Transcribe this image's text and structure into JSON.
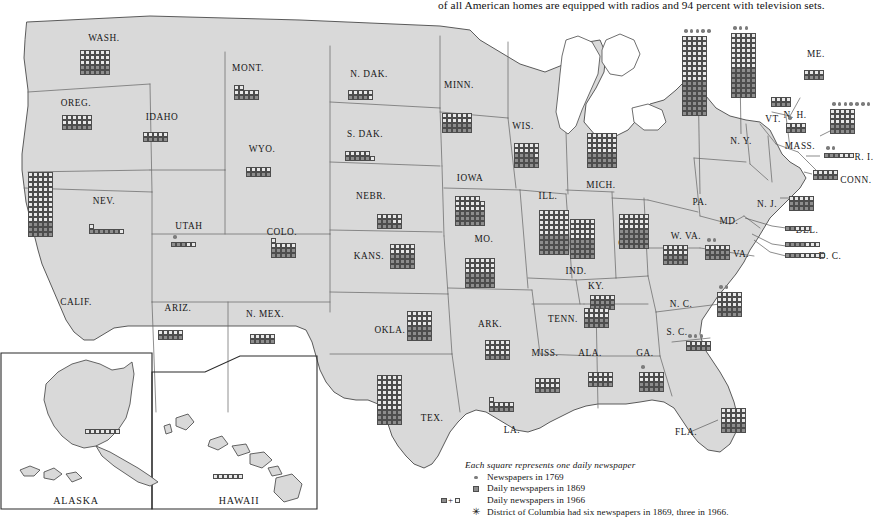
{
  "header": {
    "text": "of all American homes are equipped with radios and 94 percent with television sets."
  },
  "legend": {
    "title": "Each square represents one daily newspaper",
    "items": [
      {
        "symbol": "dot",
        "label": "Newspapers in 1769"
      },
      {
        "symbol": "dark-square",
        "label": "Daily newspapers in 1869"
      },
      {
        "symbol": "dark-plus-light-square",
        "label": "Daily newspapers in 1966"
      },
      {
        "symbol": "asterisk",
        "label": "District of Columbia had six newspapers in 1869, three in 1966."
      }
    ]
  },
  "insets": [
    {
      "name": "ALASKA"
    },
    {
      "name": "HAWAII"
    }
  ],
  "colors": {
    "land": "#d9d9d9",
    "water": "#ffffff",
    "square_1869": "#8d8d8d",
    "square_1966": "#e8e8e8",
    "border": "#4d4d4d",
    "dot": "#7c7c7c"
  },
  "chart_data": {
    "type": "map",
    "title": "Each square represents one daily newspaper",
    "unit": "one daily newspaper per square",
    "series": [
      {
        "name": "Newspapers in 1769",
        "symbol": "dot"
      },
      {
        "name": "Daily newspapers in 1869",
        "symbol": "dark square"
      },
      {
        "name": "Daily newspapers in 1966",
        "symbol": "dark + light square"
      }
    ],
    "states": [
      {
        "code": "WASH.",
        "label": "WASH.",
        "lx": 104,
        "ly": 26,
        "gx": 80,
        "gy": 38,
        "cols": 6,
        "dark": 12,
        "light": 18,
        "dots1769": 0
      },
      {
        "code": "OREG.",
        "label": "OREG.",
        "lx": 76,
        "ly": 91,
        "gx": 62,
        "gy": 103,
        "cols": 6,
        "dark": 6,
        "light": 12,
        "dots1769": 0
      },
      {
        "code": "IDAHO",
        "label": "IDAHO",
        "lx": 162,
        "ly": 105,
        "gx": 143,
        "gy": 120,
        "cols": 5,
        "dark": 5,
        "light": 5,
        "dots1769": 0
      },
      {
        "code": "MONT.",
        "label": "MONT.",
        "lx": 248,
        "ly": 56,
        "gx": 234,
        "gy": 73,
        "cols": 5,
        "dark": 5,
        "light": 7,
        "dots1769": 0
      },
      {
        "code": "WYO.",
        "label": "WYO.",
        "lx": 262,
        "ly": 137,
        "gx": 246,
        "gy": 155,
        "cols": 5,
        "dark": 5,
        "light": 5,
        "dots1769": 0
      },
      {
        "code": "N. DAK.",
        "label": "N. DAK.",
        "lx": 369,
        "ly": 62,
        "gx": 348,
        "gy": 78,
        "cols": 5,
        "dark": 4,
        "light": 6,
        "dots1769": 0
      },
      {
        "code": "S. DAK.",
        "label": "S. DAK.",
        "lx": 365,
        "ly": 122,
        "gx": 345,
        "gy": 139,
        "cols": 6,
        "dark": 5,
        "light": 6,
        "dots1769": 0
      },
      {
        "code": "MINN.",
        "label": "MINN.",
        "lx": 459,
        "ly": 73,
        "gx": 442,
        "gy": 101,
        "cols": 6,
        "dark": 12,
        "light": 12,
        "dots1769": 0
      },
      {
        "code": "WIS.",
        "label": "WIS.",
        "lx": 523,
        "ly": 114,
        "gx": 514,
        "gy": 131,
        "cols": 5,
        "dark": 14,
        "light": 11,
        "dots1769": 0
      },
      {
        "code": "MICH.",
        "label": "MICH.",
        "lx": 601,
        "ly": 173,
        "gx": 587,
        "gy": 121,
        "cols": 6,
        "dark": 18,
        "light": 24,
        "dots1769": 0
      },
      {
        "code": "IOWA",
        "label": "IOWA",
        "lx": 470,
        "ly": 166,
        "gx": 455,
        "gy": 184,
        "cols": 6,
        "dark": 18,
        "light": 17,
        "dots1769": 0
      },
      {
        "code": "NEBR.",
        "label": "NEBR.",
        "lx": 371,
        "ly": 184,
        "gx": 377,
        "gy": 202,
        "cols": 5,
        "dark": 8,
        "light": 7,
        "dots1769": 0
      },
      {
        "code": "ILL.",
        "label": "ILL.",
        "lx": 548,
        "ly": 184,
        "gx": 539,
        "gy": 198,
        "cols": 6,
        "dark": 24,
        "light": 30,
        "dots1769": 0
      },
      {
        "code": "IND.",
        "label": "IND.",
        "lx": 576,
        "ly": 259,
        "gx": 570,
        "gy": 207,
        "cols": 5,
        "dark": 20,
        "light": 20,
        "dots1769": 0
      },
      {
        "code": "OHIO",
        "label": "OHIO",
        "lx": 631,
        "ly": 231,
        "gx": 619,
        "gy": 202,
        "cols": 6,
        "dark": 24,
        "light": 18,
        "dots1769": 0
      },
      {
        "code": "COLO.",
        "label": "COLO.",
        "lx": 282,
        "ly": 220,
        "gx": 271,
        "gy": 226,
        "cols": 5,
        "dark": 10,
        "light": 6,
        "dots1769": 0
      },
      {
        "code": "UTAH",
        "label": "UTAH",
        "lx": 189,
        "ly": 214,
        "gx": 171,
        "gy": 230,
        "cols": 5,
        "dark": 3,
        "light": 2,
        "dots1769": 1
      },
      {
        "code": "NEV.",
        "label": "NEV.",
        "lx": 104,
        "ly": 189,
        "gx": 89,
        "gy": 212,
        "cols": 7,
        "dark": 6,
        "light": 2,
        "dots1769": 0
      },
      {
        "code": "CALIF.",
        "label": "CALIF.",
        "lx": 76,
        "ly": 290,
        "gx": 28,
        "gy": 160,
        "cols": 5,
        "dark": 15,
        "light": 50,
        "dots1769": 0
      },
      {
        "code": "ARIZ.",
        "label": "ARIZ.",
        "lx": 178,
        "ly": 296,
        "gx": 158,
        "gy": 318,
        "cols": 5,
        "dark": 5,
        "light": 5,
        "dots1769": 0
      },
      {
        "code": "N. MEX.",
        "label": "N. MEX.",
        "lx": 265,
        "ly": 302,
        "gx": 250,
        "gy": 322,
        "cols": 5,
        "dark": 5,
        "light": 5,
        "dots1769": 0
      },
      {
        "code": "KANS.",
        "label": "KANS.",
        "lx": 369,
        "ly": 244,
        "gx": 390,
        "gy": 232,
        "cols": 5,
        "dark": 15,
        "light": 10,
        "dots1769": 0
      },
      {
        "code": "MO.",
        "label": "MO.",
        "lx": 484,
        "ly": 227,
        "gx": 465,
        "gy": 246,
        "cols": 6,
        "dark": 18,
        "light": 18,
        "dots1769": 0
      },
      {
        "code": "KY.",
        "label": "KY.",
        "lx": 596,
        "ly": 274,
        "gx": 590,
        "gy": 283,
        "cols": 5,
        "dark": 10,
        "light": 5,
        "dots1769": 0
      },
      {
        "code": "OKLA.",
        "label": "OKLA.",
        "lx": 390,
        "ly": 318,
        "gx": 407,
        "gy": 299,
        "cols": 5,
        "dark": 15,
        "light": 15,
        "dots1769": 0
      },
      {
        "code": "ARK.",
        "label": "ARK.",
        "lx": 490,
        "ly": 312,
        "gx": 485,
        "gy": 328,
        "cols": 5,
        "dark": 5,
        "light": 15,
        "dots1769": 0
      },
      {
        "code": "TENN.",
        "label": "TENN.",
        "lx": 563,
        "ly": 307,
        "gx": 584,
        "gy": 296,
        "cols": 5,
        "dark": 10,
        "light": 10,
        "dots1769": 0
      },
      {
        "code": "MISS.",
        "label": "MISS.",
        "lx": 545,
        "ly": 341,
        "gx": 535,
        "gy": 366,
        "cols": 5,
        "dark": 5,
        "light": 10,
        "dots1769": 0
      },
      {
        "code": "ALA.",
        "label": "ALA.",
        "lx": 590,
        "ly": 341,
        "gx": 588,
        "gy": 360,
        "cols": 5,
        "dark": 5,
        "light": 10,
        "dots1769": 0
      },
      {
        "code": "GA.",
        "label": "GA.",
        "lx": 645,
        "ly": 341,
        "gx": 639,
        "gy": 360,
        "cols": 5,
        "dark": 10,
        "light": 10,
        "dots1769": 1
      },
      {
        "code": "LA.",
        "label": "LA.",
        "lx": 512,
        "ly": 418,
        "gx": 489,
        "gy": 385,
        "cols": 5,
        "dark": 5,
        "light": 6,
        "dots1769": 0
      },
      {
        "code": "TEX.",
        "label": "TEX.",
        "lx": 432,
        "ly": 406,
        "gx": 377,
        "gy": 363,
        "cols": 5,
        "dark": 15,
        "light": 35,
        "dots1769": 0
      },
      {
        "code": "FLA.",
        "label": "FLA.",
        "lx": 686,
        "ly": 420,
        "gx": 721,
        "gy": 396,
        "cols": 5,
        "dark": 10,
        "light": 15,
        "dots1769": 0
      },
      {
        "code": "S. C.",
        "label": "S. C.",
        "lx": 677,
        "ly": 320,
        "gx": 686,
        "gy": 329,
        "cols": 5,
        "dark": 5,
        "light": 5,
        "dots1769": 3
      },
      {
        "code": "N. C.",
        "label": "N. C.",
        "lx": 681,
        "ly": 292,
        "gx": 717,
        "gy": 280,
        "cols": 5,
        "dark": 10,
        "light": 15,
        "dots1769": 2
      },
      {
        "code": "VA.",
        "label": "VA.",
        "lx": 741,
        "ly": 242,
        "gx": 705,
        "gy": 233,
        "cols": 5,
        "dark": 10,
        "light": 5,
        "dots1769": 2
      },
      {
        "code": "W. VA.",
        "label": "W. VA.",
        "lx": 686,
        "ly": 224,
        "gx": 663,
        "gy": 233,
        "cols": 5,
        "dark": 10,
        "light": 10,
        "dots1769": 0
      },
      {
        "code": "MD.",
        "label": "MD.",
        "lx": 729,
        "ly": 209,
        "gx": 785,
        "gy": 230,
        "cols": 7,
        "dark": 4,
        "light": 3,
        "dots1769": 0
      },
      {
        "code": "DEL.",
        "label": "DEL.",
        "lx": 807,
        "ly": 218,
        "gx": 785,
        "gy": 214,
        "cols": 5,
        "dark": 2,
        "light": 3,
        "dots1769": 0
      },
      {
        "code": "D. C.",
        "label": "D. C.",
        "lx": 830,
        "ly": 244,
        "gx": 785,
        "gy": 241,
        "cols": 8,
        "dark": 3,
        "light": 5,
        "dots1769": 0
      },
      {
        "code": "N. J.",
        "label": "N. J.",
        "lx": 767,
        "ly": 192,
        "gx": 789,
        "gy": 184,
        "cols": 5,
        "dark": 10,
        "light": 5,
        "dots1769": 0
      },
      {
        "code": "PA.",
        "label": "PA.",
        "lx": 700,
        "ly": 190,
        "gx": 682,
        "gy": 24,
        "cols": 5,
        "dark": 35,
        "light": 45,
        "dots1769": 5
      },
      {
        "code": "N. Y.",
        "label": "N. Y.",
        "lx": 741,
        "ly": 129,
        "gx": 731,
        "gy": 21,
        "cols": 5,
        "dark": 30,
        "light": 35,
        "dots1769": 3
      },
      {
        "code": "CONN.",
        "label": "CONN.",
        "lx": 856,
        "ly": 168,
        "gx": 813,
        "gy": 158,
        "cols": 5,
        "dark": 5,
        "light": 5,
        "dots1769": 0
      },
      {
        "code": "R. I.",
        "label": "R. I.",
        "lx": 864,
        "ly": 145,
        "gx": 824,
        "gy": 141,
        "cols": 6,
        "dark": 3,
        "light": 3,
        "dots1769": 2
      },
      {
        "code": "MASS.",
        "label": "MASS.",
        "lx": 800,
        "ly": 134,
        "gx": 830,
        "gy": 97,
        "cols": 5,
        "dark": 10,
        "light": 15,
        "dots1769": 7
      },
      {
        "code": "N. H.",
        "label": "N. H.",
        "lx": 795,
        "ly": 103,
        "gx": 786,
        "gy": 111,
        "cols": 4,
        "dark": 4,
        "light": 4,
        "dots1769": 1
      },
      {
        "code": "VT.",
        "label": "VT.",
        "lx": 773,
        "ly": 107,
        "gx": 771,
        "gy": 85,
        "cols": 4,
        "dark": 4,
        "light": 4,
        "dots1769": 0
      },
      {
        "code": "ME.",
        "label": "ME.",
        "lx": 816,
        "ly": 42,
        "gx": 804,
        "gy": 58,
        "cols": 4,
        "dark": 4,
        "light": 4,
        "dots1769": 0
      },
      {
        "code": "ALASKA",
        "label": "ALASKA",
        "lx": 125,
        "ly": 490,
        "gx": 85,
        "gy": 417,
        "cols": 7,
        "dark": 0,
        "light": 7,
        "dots1769": 0
      },
      {
        "code": "HAWAII",
        "label": "HAWAII",
        "lx": 239,
        "ly": 490,
        "gx": 213,
        "gy": 462,
        "cols": 6,
        "dark": 0,
        "light": 6,
        "dots1769": 0
      }
    ]
  }
}
